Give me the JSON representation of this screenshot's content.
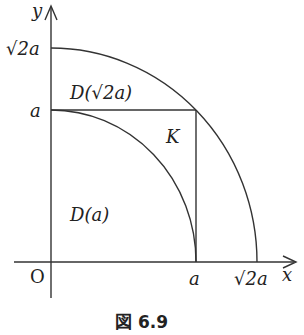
{
  "figure": {
    "caption": "図 6.9",
    "axes": {
      "x_label": "x",
      "y_label": "y",
      "origin_label": "O"
    },
    "ticks": {
      "x": [
        "a",
        "√2a"
      ],
      "y": [
        "√2a",
        "a"
      ]
    },
    "regions": {
      "inner": "D(a)",
      "outer": "D(√2a)",
      "square_corner": "K"
    },
    "colors": {
      "stroke": "#333333",
      "background": "#ffffff"
    }
  }
}
